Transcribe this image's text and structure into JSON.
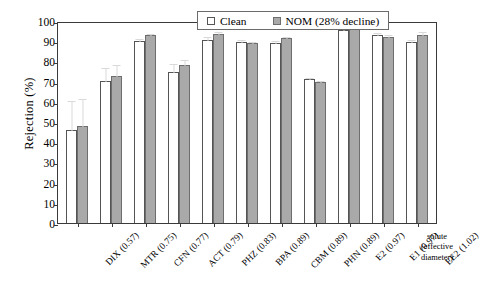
{
  "chart_data": {
    "type": "bar",
    "title": "",
    "xlabel": "solute (effective diameter)",
    "ylabel": "Rejection (%)",
    "ylim": [
      0,
      100
    ],
    "ytick_step": 10,
    "yticks": [
      0,
      10,
      20,
      30,
      40,
      50,
      60,
      70,
      80,
      90,
      100
    ],
    "grid": false,
    "legend_position": "top-center",
    "categories": [
      "DIX (0.57)",
      "MTR (0.75)",
      "CFN (0.77)",
      "ACT (0.79)",
      "PHZ (0.83)",
      "BPA (0.89)",
      "CBM (0.89)",
      "PHN (0.89)",
      "E2 (0.97)",
      "E1 (0.97)",
      "EE2 (1.02)"
    ],
    "series": [
      {
        "name": "Clean",
        "color": "#ffffff",
        "values": [
          46,
          70.5,
          90,
          75,
          90.5,
          89.5,
          89,
          71.5,
          95.5,
          93,
          89.5
        ],
        "errors": [
          15,
          6.5,
          1.5,
          4,
          2,
          1.5,
          1.5,
          1,
          1.5,
          1.5,
          1.5
        ]
      },
      {
        "name": "NOM (28% decline)",
        "color": "#a9a9a9",
        "values": [
          48,
          73,
          93,
          78,
          93.5,
          89,
          91.5,
          70,
          96.5,
          92,
          93
        ],
        "errors": [
          14,
          5.5,
          1,
          3,
          1.5,
          1,
          1,
          1,
          1,
          1.5,
          2
        ]
      }
    ]
  },
  "axis": {
    "y_title": "Rejection (%)"
  },
  "legend": {
    "clean_label": "Clean",
    "nom_label": "NOM (28% decline)"
  },
  "solute_caption": {
    "line1": "solute",
    "line2": "(effective",
    "line3": "diameter)"
  }
}
